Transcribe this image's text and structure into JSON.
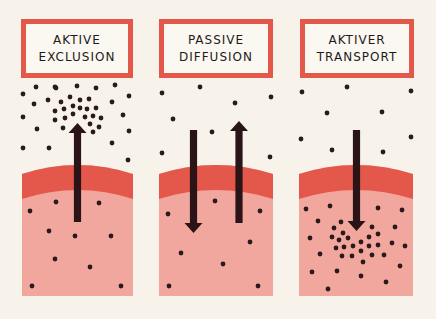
{
  "colors": {
    "background": "#f7f3ea",
    "label_border": "#e4574b",
    "membrane": "#e4574b",
    "cell_interior": "#f1a79d",
    "particle": "#2a1a1c",
    "arrow": "#2a1418"
  },
  "panels": [
    {
      "id": "aktive-exclusion",
      "label_line1": "AKTIVE",
      "label_line2": "EXCLUSION",
      "box": {
        "x": 21,
        "y": 19,
        "w": 112,
        "h": 59
      },
      "cell": {
        "x1": 22,
        "x2": 133,
        "bottom": 296
      },
      "arrows": [
        {
          "direction": "up",
          "x": 77.5,
          "top": 123,
          "bottom": 222
        }
      ],
      "particles": [
        [
          36,
          87
        ],
        [
          55,
          87
        ],
        [
          77,
          86
        ],
        [
          96,
          88
        ],
        [
          115,
          85
        ],
        [
          23,
          94
        ],
        [
          34,
          104
        ],
        [
          129,
          96
        ],
        [
          112,
          102
        ],
        [
          23,
          117
        ],
        [
          37,
          129
        ],
        [
          123,
          115
        ],
        [
          129,
          131
        ],
        [
          23,
          148
        ],
        [
          49,
          148
        ],
        [
          112,
          143
        ],
        [
          128,
          160
        ],
        [
          56,
          88
        ],
        [
          48,
          100
        ],
        [
          61,
          102
        ],
        [
          70,
          97
        ],
        [
          80,
          100
        ],
        [
          89,
          99
        ],
        [
          55,
          111
        ],
        [
          64,
          109
        ],
        [
          73,
          106
        ],
        [
          80,
          108
        ],
        [
          87,
          109
        ],
        [
          96,
          108
        ],
        [
          55,
          120
        ],
        [
          65,
          118
        ],
        [
          73,
          114
        ],
        [
          85,
          117
        ],
        [
          93,
          116
        ],
        [
          101,
          118
        ],
        [
          63,
          128
        ],
        [
          90,
          124
        ],
        [
          99,
          127
        ],
        [
          93,
          132
        ],
        [
          56,
          202
        ],
        [
          99,
          203
        ],
        [
          30,
          211
        ],
        [
          49,
          231
        ],
        [
          75,
          236
        ],
        [
          111,
          236
        ],
        [
          55,
          259
        ],
        [
          90,
          267
        ],
        [
          32,
          286
        ],
        [
          121,
          286
        ]
      ]
    },
    {
      "id": "passive-diffusion",
      "label_line1": "PASSIVE",
      "label_line2": "DIFFUSION",
      "box": {
        "x": 159,
        "y": 19,
        "w": 114,
        "h": 59
      },
      "cell": {
        "x1": 159,
        "x2": 273,
        "bottom": 296
      },
      "arrows": [
        {
          "direction": "down",
          "x": 193.5,
          "top": 130,
          "bottom": 233
        },
        {
          "direction": "up",
          "x": 239,
          "top": 121,
          "bottom": 223
        }
      ],
      "particles": [
        [
          162,
          93
        ],
        [
          200,
          87
        ],
        [
          271,
          97
        ],
        [
          235,
          103
        ],
        [
          173,
          119
        ],
        [
          212,
          132
        ],
        [
          162,
          153
        ],
        [
          270,
          157
        ],
        [
          215,
          201
        ],
        [
          168,
          214
        ],
        [
          260,
          211
        ],
        [
          250,
          242
        ],
        [
          181,
          253
        ],
        [
          223,
          264
        ],
        [
          169,
          286
        ],
        [
          258,
          286
        ]
      ]
    },
    {
      "id": "aktiver-transport",
      "label_line1": "AKTIVER",
      "label_line2": "TRANSPORT",
      "box": {
        "x": 300,
        "y": 19,
        "w": 114,
        "h": 59
      },
      "cell": {
        "x1": 299,
        "x2": 413,
        "bottom": 296
      },
      "arrows": [
        {
          "direction": "down",
          "x": 356.5,
          "top": 130,
          "bottom": 231
        }
      ],
      "particles": [
        [
          302,
          92
        ],
        [
          347,
          87
        ],
        [
          411,
          91
        ],
        [
          327,
          113
        ],
        [
          382,
          112
        ],
        [
          301,
          139
        ],
        [
          411,
          137
        ],
        [
          332,
          150
        ],
        [
          383,
          152
        ],
        [
          306,
          209
        ],
        [
          330,
          206
        ],
        [
          378,
          208
        ],
        [
          402,
          210
        ],
        [
          318,
          221
        ],
        [
          341,
          222
        ],
        [
          334,
          228
        ],
        [
          372,
          227
        ],
        [
          395,
          227
        ],
        [
          310,
          238
        ],
        [
          332,
          237
        ],
        [
          343,
          233
        ],
        [
          339,
          240
        ],
        [
          348,
          238
        ],
        [
          369,
          237
        ],
        [
          378,
          234
        ],
        [
          336,
          248
        ],
        [
          344,
          247
        ],
        [
          353,
          246
        ],
        [
          361,
          242
        ],
        [
          369,
          246
        ],
        [
          378,
          245
        ],
        [
          392,
          243
        ],
        [
          405,
          246
        ],
        [
          320,
          254
        ],
        [
          342,
          256
        ],
        [
          352,
          256
        ],
        [
          361,
          251
        ],
        [
          372,
          255
        ],
        [
          384,
          255
        ],
        [
          363,
          262
        ],
        [
          400,
          266
        ],
        [
          312,
          272
        ],
        [
          337,
          271
        ],
        [
          361,
          276
        ],
        [
          386,
          282
        ],
        [
          328,
          289
        ]
      ]
    }
  ]
}
